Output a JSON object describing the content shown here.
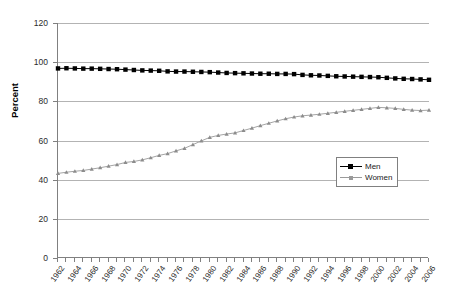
{
  "chart_data": {
    "type": "line",
    "title": "",
    "xlabel": "",
    "ylabel": "Percent",
    "ylim": [
      0,
      120
    ],
    "ytick_values": [
      0,
      20,
      40,
      60,
      80,
      100,
      120
    ],
    "xlim": [
      1962,
      2006
    ],
    "grid": true,
    "legend_position": "right-middle",
    "x": [
      1962,
      1963,
      1964,
      1965,
      1966,
      1967,
      1968,
      1969,
      1970,
      1971,
      1972,
      1973,
      1974,
      1975,
      1976,
      1977,
      1978,
      1979,
      1980,
      1981,
      1982,
      1983,
      1984,
      1985,
      1986,
      1987,
      1988,
      1989,
      1990,
      1991,
      1992,
      1993,
      1994,
      1995,
      1996,
      1997,
      1998,
      1999,
      2000,
      2001,
      2002,
      2003,
      2004,
      2005,
      2006
    ],
    "xtick_labels": [
      "1962",
      "1964",
      "1966",
      "1968",
      "1970",
      "1972",
      "1974",
      "1976",
      "1978",
      "1980",
      "1982",
      "1984",
      "1986",
      "1988",
      "1990",
      "1992",
      "1994",
      "1996",
      "1998",
      "2000",
      "2002",
      "2004",
      "2006"
    ],
    "series": [
      {
        "name": "Men",
        "marker": "filled-square",
        "color": "#000000",
        "values": [
          96.8,
          96.9,
          96.8,
          96.7,
          96.7,
          96.6,
          96.5,
          96.4,
          96.2,
          96.0,
          95.8,
          95.7,
          95.6,
          95.3,
          95.2,
          95.2,
          95.1,
          95.0,
          94.9,
          94.7,
          94.5,
          94.4,
          94.3,
          94.2,
          94.1,
          94.1,
          94.0,
          94.0,
          93.9,
          93.5,
          93.3,
          93.2,
          93.0,
          92.8,
          92.7,
          92.6,
          92.5,
          92.4,
          92.3,
          92.0,
          91.7,
          91.5,
          91.4,
          91.2,
          91.0
        ]
      },
      {
        "name": "Women",
        "marker": "small-triangle",
        "color": "#808080",
        "values": [
          43.2,
          43.8,
          44.3,
          44.7,
          45.4,
          46.1,
          46.9,
          47.7,
          48.8,
          49.3,
          50.1,
          51.2,
          52.4,
          53.3,
          54.7,
          56.0,
          57.9,
          59.8,
          61.6,
          62.6,
          63.3,
          63.9,
          65.1,
          66.3,
          67.6,
          68.8,
          70.0,
          71.1,
          72.0,
          72.6,
          73.0,
          73.4,
          73.9,
          74.4,
          74.9,
          75.4,
          75.9,
          76.4,
          76.9,
          76.7,
          76.4,
          75.9,
          75.5,
          75.3,
          75.5
        ]
      }
    ]
  }
}
